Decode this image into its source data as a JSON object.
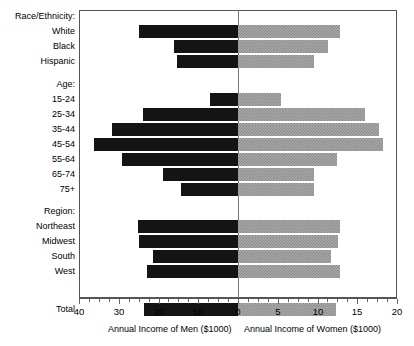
{
  "chart_data": {
    "type": "bar",
    "orientation": "horizontal",
    "subtype": "population-pyramid",
    "title": "",
    "xlabel_left": "Annual Income of Men ($1000)",
    "xlabel_right": "Annual Income of Women ($1000)",
    "ylabel": "",
    "grid": false,
    "legend": "none",
    "axis_left": {
      "name": "Annual Income of Men ($1000)",
      "range": [
        40,
        0
      ],
      "direction": "right-to-left",
      "major_ticks": [
        40,
        30,
        20,
        10,
        0
      ],
      "tick_labels": [
        "40",
        "30",
        "20",
        "10",
        "0"
      ],
      "minor_tick_step": 2.5
    },
    "axis_right": {
      "name": "Annual Income of Women ($1000)",
      "range": [
        0,
        20
      ],
      "direction": "left-to-right",
      "major_ticks": [
        0,
        5,
        10,
        15,
        20
      ],
      "tick_labels": [
        "0",
        "5",
        "10",
        "15",
        "20"
      ],
      "minor_tick_step": 1.25
    },
    "groups": [
      {
        "heading": "Race/Ethnicity:",
        "categories": [
          "White",
          "Black",
          "Hispanic"
        ],
        "series": [
          {
            "name": "Men",
            "values": [
              24.9,
              16.1,
              15.3
            ]
          },
          {
            "name": "Women",
            "values": [
              12.8,
              11.3,
              9.6
            ]
          }
        ]
      },
      {
        "heading": "Age:",
        "categories": [
          "15-24",
          "25-34",
          "35-44",
          "45-54",
          "55-64",
          "65-74",
          "75+"
        ],
        "series": [
          {
            "name": "Men",
            "values": [
              7.0,
              23.9,
              31.7,
              36.2,
              29.2,
              18.9,
              14.3
            ]
          },
          {
            "name": "Women",
            "values": [
              5.4,
              16.0,
              17.7,
              18.2,
              12.5,
              9.6,
              9.6
            ]
          }
        ]
      },
      {
        "heading": "Region:",
        "categories": [
          "Northeast",
          "Midwest",
          "South",
          "West"
        ],
        "series": [
          {
            "name": "Men",
            "values": [
              25.2,
              24.9,
              21.4,
              22.9
            ]
          },
          {
            "name": "Women",
            "values": [
              12.8,
              12.6,
              11.7,
              12.8
            ]
          }
        ]
      },
      {
        "heading": "",
        "categories": [
          "Total"
        ],
        "series": [
          {
            "name": "Men",
            "values": [
              23.6
            ]
          },
          {
            "name": "Women",
            "values": [
              12.3
            ]
          }
        ]
      }
    ],
    "colors": {
      "men_bar": "#141414",
      "women_bar": "#a8a8a8",
      "frame": "#555555",
      "background": "#ffffff"
    }
  }
}
